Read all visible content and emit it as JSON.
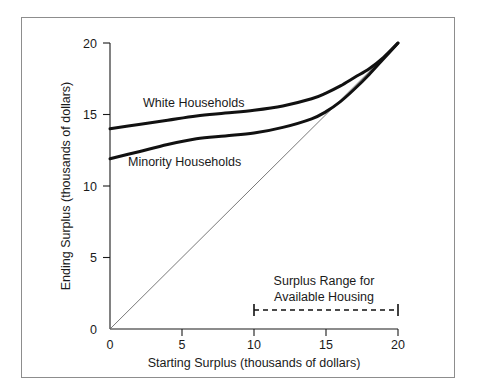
{
  "figure": {
    "frame_color": "#8d8d8d",
    "background": "#ffffff"
  },
  "chart_data": {
    "type": "line",
    "title": "",
    "xlabel": "Starting Surplus (thousands of dollars)",
    "ylabel": "Ending Surplus (thousands of dollars)",
    "xlim": [
      0,
      20
    ],
    "ylim": [
      0,
      20
    ],
    "xticks": [
      0,
      5,
      10,
      15,
      20
    ],
    "yticks": [
      0,
      5,
      10,
      15,
      20
    ],
    "xtick_labels": [
      "0",
      "5",
      "10",
      "15",
      "20"
    ],
    "ytick_labels": [
      "0",
      "5",
      "10",
      "15",
      "20"
    ],
    "grid": false,
    "legend_position": "inline-annotation",
    "series": [
      {
        "name": "White Households",
        "label_text": "White Households",
        "color": "#111111",
        "x": [
          0,
          2,
          4,
          6,
          8,
          10,
          12,
          14,
          15,
          16,
          17,
          18,
          19,
          20
        ],
        "values": [
          14.0,
          14.3,
          14.6,
          14.9,
          15.1,
          15.3,
          15.6,
          16.1,
          16.5,
          17.0,
          17.6,
          18.2,
          19.0,
          20.0
        ]
      },
      {
        "name": "Minority Households",
        "label_text": "Minority Households",
        "color": "#111111",
        "x": [
          0,
          2,
          4,
          6,
          8,
          10,
          12,
          14,
          15,
          16,
          17,
          18,
          19,
          20
        ],
        "values": [
          11.9,
          12.4,
          12.9,
          13.3,
          13.5,
          13.7,
          14.1,
          14.7,
          15.2,
          15.9,
          16.8,
          17.8,
          18.9,
          20.0
        ]
      },
      {
        "name": "45 degree reference line",
        "label_text": "",
        "color": "#6a6a6a",
        "x": [
          0,
          20
        ],
        "values": [
          0,
          20
        ]
      }
    ],
    "annotations": [
      {
        "name": "surplus-range-annotation",
        "text_line_1": "Surplus Range for",
        "text_line_2": "Available Housing",
        "range_start": 10,
        "range_end": 20,
        "range_y": 1.35,
        "style": "dashed-bar-with-end-caps"
      }
    ]
  }
}
